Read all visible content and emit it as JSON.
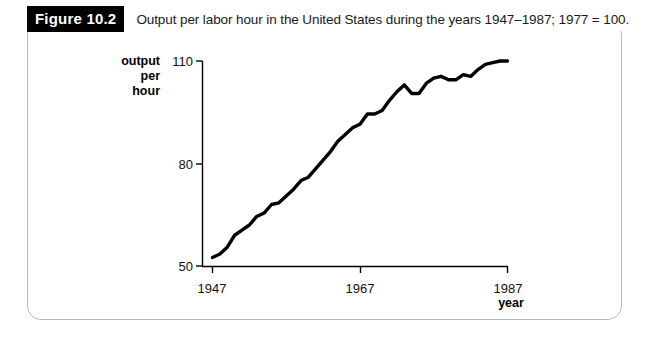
{
  "figure": {
    "tag": "Figure 10.2",
    "caption": "Output per labor hour in the United States during the years 1947–1987; 1977 = 100."
  },
  "axes": {
    "y_title_line1": "output",
    "y_title_line2": "per",
    "y_title_line3": "hour",
    "x_title": "year",
    "y_ticks": [
      "110",
      "80",
      "50"
    ],
    "x_ticks": [
      "1947",
      "1967",
      "1987"
    ]
  },
  "chart_data": {
    "type": "line",
    "title": "Output per labor hour in the United States during the years 1947–1987; 1977 = 100.",
    "xlabel": "year",
    "ylabel": "output per hour",
    "xlim": [
      1947,
      1987
    ],
    "ylim": [
      50,
      110
    ],
    "xticks": [
      1947,
      1967,
      1987
    ],
    "yticks": [
      50,
      80,
      110
    ],
    "grid": false,
    "legend": false,
    "series": [
      {
        "name": "Output per labor hour (1977 = 100)",
        "color": "#000000",
        "x": [
          1947,
          1948,
          1949,
          1950,
          1951,
          1952,
          1953,
          1954,
          1955,
          1956,
          1957,
          1958,
          1959,
          1960,
          1961,
          1962,
          1963,
          1964,
          1965,
          1966,
          1967,
          1968,
          1969,
          1970,
          1971,
          1972,
          1973,
          1974,
          1975,
          1976,
          1977,
          1978,
          1979,
          1980,
          1981,
          1982,
          1983,
          1984,
          1985,
          1986,
          1987
        ],
        "values": [
          52.5,
          53.5,
          55.5,
          59.0,
          60.5,
          62.0,
          64.5,
          65.5,
          68.0,
          68.5,
          70.5,
          72.5,
          75.0,
          76.0,
          78.5,
          81.0,
          83.5,
          86.5,
          88.5,
          90.5,
          91.5,
          94.5,
          94.5,
          95.5,
          98.5,
          101.0,
          103.0,
          100.5,
          100.5,
          103.5,
          105.0,
          105.5,
          104.5,
          104.5,
          106.0,
          105.5,
          107.5,
          109.0,
          109.5,
          110.0,
          110.0
        ]
      }
    ]
  }
}
